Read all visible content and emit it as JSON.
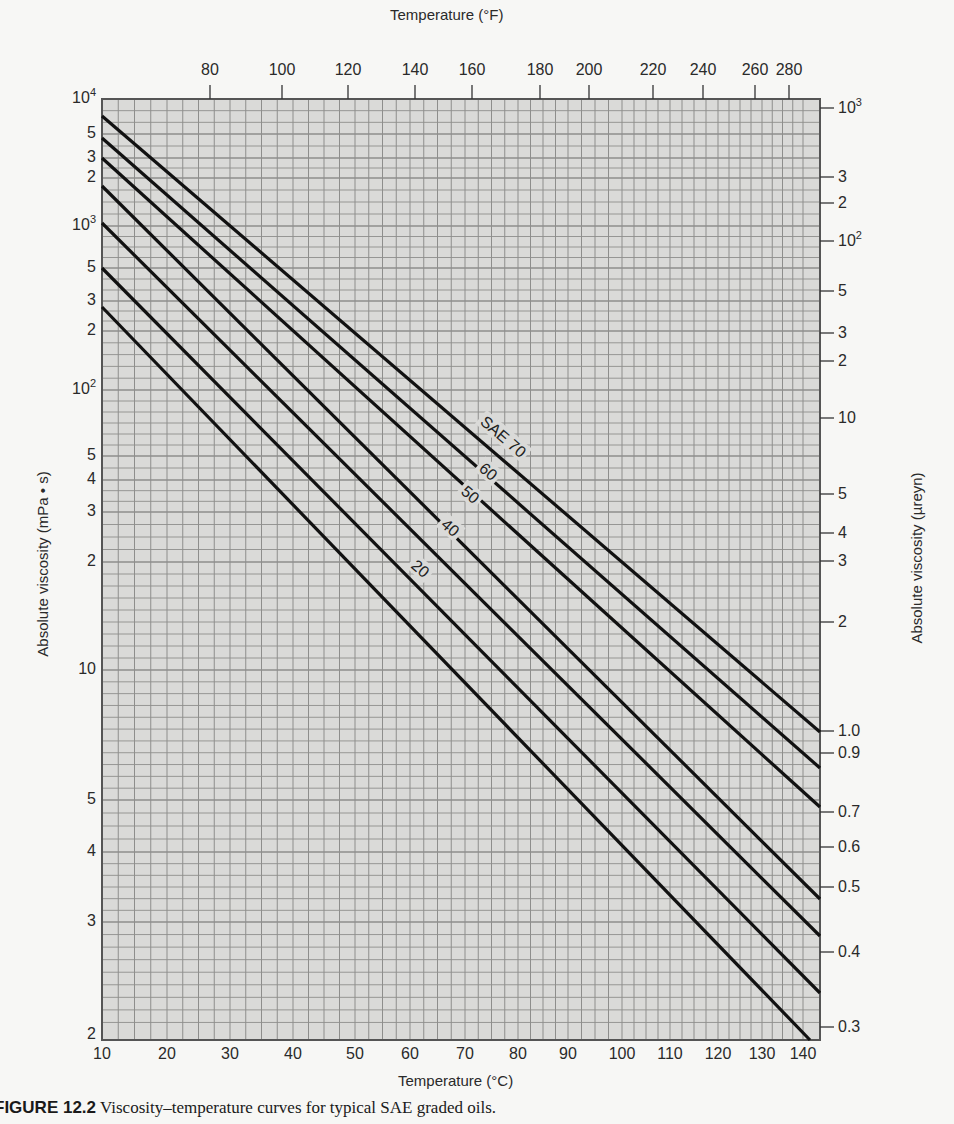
{
  "chart_data": {
    "type": "line",
    "xlabel": "Temperature (°C)",
    "x2label": "Temperature (°F)",
    "ylabel": "Absolute viscosity (mPa • s)",
    "y2label": "Absolute viscosity (µreyn)",
    "xlim": [
      10,
      142
    ],
    "ylim_mPa_s": [
      2,
      10000
    ],
    "ylim_ureyn": [
      0.29,
      1450
    ],
    "xscale": "ASTM viscosity-temperature (non-linear)",
    "yscale": "log-log (ASTM)",
    "grid": true,
    "x_ticks_C": [
      10,
      20,
      30,
      40,
      50,
      60,
      70,
      80,
      90,
      100,
      110,
      120,
      130,
      140
    ],
    "x_ticks_F": [
      80,
      100,
      120,
      140,
      160,
      180,
      200,
      220,
      240,
      260,
      280
    ],
    "y_ticks_left": [
      "10^4",
      "5",
      "3",
      "2",
      "10^3",
      "5",
      "3",
      "2",
      "10^2",
      "5",
      "4",
      "3",
      "2",
      "10",
      "5",
      "4",
      "3",
      "2"
    ],
    "y_ticks_right": [
      "10^3",
      "3",
      "2",
      "10^2",
      "5",
      "3",
      "2",
      "10",
      "5",
      "4",
      "3",
      "2",
      "1.0",
      "0.9",
      "0.7",
      "0.6",
      "0.5",
      "0.4",
      "0.3"
    ],
    "series": [
      {
        "name": "SAE 70",
        "label": "SAE 70",
        "x_C": [
          10,
          142
        ],
        "y_ureyn_at_142C": 1.0
      },
      {
        "name": "SAE 60",
        "label": "60",
        "x_C": [
          10,
          142
        ],
        "y_ureyn_at_142C": 0.85
      },
      {
        "name": "SAE 50",
        "label": "50",
        "x_C": [
          10,
          142
        ],
        "y_ureyn_at_142C": 0.7
      },
      {
        "name": "SAE 40",
        "label": "40",
        "x_C": [
          10,
          142
        ],
        "y_ureyn_at_142C": 0.47
      },
      {
        "name": "SAE 30",
        "label": "",
        "x_C": [
          10,
          142
        ],
        "y_ureyn_at_142C": 0.42
      },
      {
        "name": "SAE 20",
        "label": "20",
        "x_C": [
          10,
          142
        ],
        "y_ureyn_at_142C": 0.36
      },
      {
        "name": "SAE 10",
        "label": "",
        "x_C": [
          10,
          140
        ],
        "y_ureyn_at_140C": 0.29
      }
    ],
    "annotations": [
      "SAE 70",
      "60",
      "50",
      "40",
      "20"
    ]
  },
  "axes": {
    "top_title": "Temperature (°F)",
    "bottom_title": "Temperature (°C)",
    "left_title": "Absolute viscosity (mPa • s)",
    "right_title": "Absolute viscosity (µreyn)"
  },
  "bottom_ticks": [
    {
      "label": "10",
      "x": 102
    },
    {
      "label": "20",
      "x": 167
    },
    {
      "label": "30",
      "x": 230
    },
    {
      "label": "40",
      "x": 293
    },
    {
      "label": "50",
      "x": 355
    },
    {
      "label": "60",
      "x": 410
    },
    {
      "label": "70",
      "x": 465
    },
    {
      "label": "80",
      "x": 518
    },
    {
      "label": "90",
      "x": 568
    },
    {
      "label": "100",
      "x": 622
    },
    {
      "label": "110",
      "x": 670
    },
    {
      "label": "120",
      "x": 718
    },
    {
      "label": "130",
      "x": 762
    },
    {
      "label": "140",
      "x": 803
    }
  ],
  "top_ticks": [
    {
      "label": "80",
      "x": 210
    },
    {
      "label": "100",
      "x": 282
    },
    {
      "label": "120",
      "x": 348
    },
    {
      "label": "140",
      "x": 415
    },
    {
      "label": "160",
      "x": 472
    },
    {
      "label": "180",
      "x": 540
    },
    {
      "label": "200",
      "x": 589
    },
    {
      "label": "220",
      "x": 653
    },
    {
      "label": "240",
      "x": 703
    },
    {
      "label": "260",
      "x": 755
    },
    {
      "label": "280",
      "x": 789
    }
  ],
  "left_ticks": [
    {
      "base": "10",
      "exp": "4",
      "y": 99
    },
    {
      "base": "5",
      "exp": "",
      "y": 134
    },
    {
      "base": "3",
      "exp": "",
      "y": 158
    },
    {
      "base": "2",
      "exp": "",
      "y": 178
    },
    {
      "base": "10",
      "exp": "3",
      "y": 226
    },
    {
      "base": "5",
      "exp": "",
      "y": 268
    },
    {
      "base": "3",
      "exp": "",
      "y": 301
    },
    {
      "base": "2",
      "exp": "",
      "y": 331
    },
    {
      "base": "10",
      "exp": "2",
      "y": 390
    },
    {
      "base": "5",
      "exp": "",
      "y": 456
    },
    {
      "base": "4",
      "exp": "",
      "y": 480
    },
    {
      "base": "3",
      "exp": "",
      "y": 512
    },
    {
      "base": "2",
      "exp": "",
      "y": 562
    },
    {
      "base": "10",
      "exp": "",
      "y": 670
    },
    {
      "base": "5",
      "exp": "",
      "y": 800
    },
    {
      "base": "4",
      "exp": "",
      "y": 852
    },
    {
      "base": "3",
      "exp": "",
      "y": 922
    },
    {
      "base": "2",
      "exp": "",
      "y": 1035
    }
  ],
  "right_ticks": [
    {
      "base": "10",
      "exp": "3",
      "y": 108
    },
    {
      "base": "3",
      "exp": "",
      "y": 177
    },
    {
      "base": "2",
      "exp": "",
      "y": 203
    },
    {
      "base": "10",
      "exp": "2",
      "y": 241
    },
    {
      "base": "5",
      "exp": "",
      "y": 291
    },
    {
      "base": "3",
      "exp": "",
      "y": 333
    },
    {
      "base": "2",
      "exp": "",
      "y": 361
    },
    {
      "base": "10",
      "exp": "",
      "y": 418
    },
    {
      "base": "5",
      "exp": "",
      "y": 494
    },
    {
      "base": "4",
      "exp": "",
      "y": 533
    },
    {
      "base": "3",
      "exp": "",
      "y": 561
    },
    {
      "base": "2",
      "exp": "",
      "y": 622
    },
    {
      "base": "1.0",
      "exp": "",
      "y": 731
    },
    {
      "base": "0.9",
      "exp": "",
      "y": 753
    },
    {
      "base": "0.7",
      "exp": "",
      "y": 812
    },
    {
      "base": "0.6",
      "exp": "",
      "y": 847
    },
    {
      "base": "0.5",
      "exp": "",
      "y": 887
    },
    {
      "base": "0.4",
      "exp": "",
      "y": 952
    },
    {
      "base": "0.3",
      "exp": "",
      "y": 1027
    }
  ],
  "curves": [
    {
      "name": "SAE 70",
      "x1": 102,
      "y1": 116,
      "x2": 820,
      "y2": 732
    },
    {
      "name": "SAE 60",
      "x1": 102,
      "y1": 138,
      "x2": 820,
      "y2": 768
    },
    {
      "name": "SAE 50",
      "x1": 102,
      "y1": 158,
      "x2": 820,
      "y2": 807
    },
    {
      "name": "SAE 40",
      "x1": 102,
      "y1": 186,
      "x2": 820,
      "y2": 899
    },
    {
      "name": "SAE 30",
      "x1": 102,
      "y1": 223,
      "x2": 820,
      "y2": 936
    },
    {
      "name": "SAE 20",
      "x1": 102,
      "y1": 268,
      "x2": 820,
      "y2": 993
    },
    {
      "name": "SAE 10",
      "x1": 102,
      "y1": 307,
      "x2": 810,
      "y2": 1040
    }
  ],
  "curve_labels": [
    {
      "text": "SAE 70",
      "x": 503,
      "y": 437
    },
    {
      "text": "60",
      "x": 488,
      "y": 472
    },
    {
      "text": "50",
      "x": 470,
      "y": 495
    },
    {
      "text": "40",
      "x": 450,
      "y": 528
    },
    {
      "text": "20",
      "x": 420,
      "y": 569
    }
  ],
  "caption": {
    "label": "FIGURE 12.2",
    "text": "Viscosity–temperature curves for typical SAE graded oils."
  }
}
